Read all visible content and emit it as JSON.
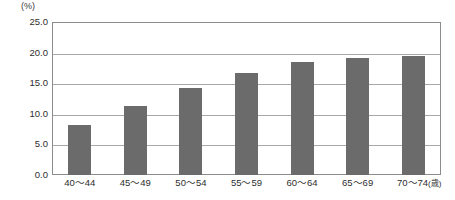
{
  "chart_data": {
    "type": "bar",
    "title": "",
    "subtitle": "",
    "xlabel": "",
    "ylabel": "",
    "unit_label": "(%)",
    "age_unit_suffix": "(歳)",
    "categories": [
      "40～44",
      "45～49",
      "50～54",
      "55～59",
      "60～64",
      "65～69",
      "70～74"
    ],
    "values": [
      8.2,
      11.3,
      14.2,
      16.7,
      18.5,
      19.2,
      19.5
    ],
    "ylim": [
      0.0,
      25.0
    ],
    "ytick_values": [
      25.0,
      20.0,
      15.0,
      10.0,
      5.0,
      0.0
    ],
    "ytick_labels": [
      "25.0",
      "20.0",
      "15.0",
      "10.0",
      "5.0",
      "0.0"
    ],
    "grid": true,
    "grid_axis": "y",
    "legend": false,
    "legend_position": "none",
    "bar_color": "#6b6b6b",
    "grid_color": "#a8a8a8",
    "frame_color": "#8c8c8c",
    "background_color": "#ffffff"
  }
}
